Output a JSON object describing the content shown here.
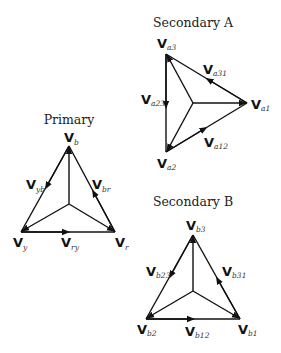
{
  "diagrams": {
    "primary": {
      "title": "Primary",
      "vertices": {
        "b": {
          "main": "V",
          "sub": "b"
        },
        "y": {
          "main": "V",
          "sub": "y"
        },
        "r": {
          "main": "V",
          "sub": "r"
        }
      },
      "edges": {
        "yb": {
          "main": "V",
          "sub": "yb"
        },
        "br": {
          "main": "V",
          "sub": "br"
        },
        "ry": {
          "main": "V",
          "sub": "ry"
        }
      }
    },
    "secondary_a": {
      "title": "Secondary A",
      "vertices": {
        "a3": {
          "main": "V",
          "sub": "a3"
        },
        "a2": {
          "main": "V",
          "sub": "a2"
        },
        "a1": {
          "main": "V",
          "sub": "a1"
        }
      },
      "edges": {
        "a31": {
          "main": "V",
          "sub": "a31"
        },
        "a23": {
          "main": "V",
          "sub": "a23"
        },
        "a12": {
          "main": "V",
          "sub": "a12"
        }
      }
    },
    "secondary_b": {
      "title": "Secondary B",
      "vertices": {
        "b3": {
          "main": "V",
          "sub": "b3"
        },
        "b2": {
          "main": "V",
          "sub": "b2"
        },
        "b1": {
          "main": "V",
          "sub": "b1"
        }
      },
      "edges": {
        "b23": {
          "main": "V",
          "sub": "b23"
        },
        "b31": {
          "main": "V",
          "sub": "b31"
        },
        "b12": {
          "main": "V",
          "sub": "b12"
        }
      }
    }
  },
  "colors": {
    "line": "#111111",
    "background": "#ffffff"
  }
}
